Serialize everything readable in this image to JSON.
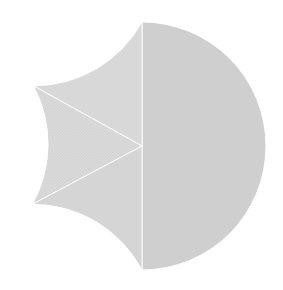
{
  "chart_data": {
    "type": "pie",
    "title": "",
    "subtitle": "",
    "xlabel": "",
    "ylabel": "",
    "grid": false,
    "legend_position": "none",
    "start_angle_deg": 90,
    "direction": "counterclockwise",
    "center_x": 142,
    "center_y": 146,
    "radius": 124,
    "categories": [
      "Slice 1",
      "Slice 2",
      "Slice 3",
      "Slice 4"
    ],
    "values": [
      50,
      17,
      16,
      17
    ],
    "labels": [
      "",
      "",
      "",
      ""
    ],
    "tick_labels": [],
    "annotations": [],
    "slices": [
      {
        "name": "Slice 1",
        "value": 50,
        "percent": 50,
        "start_deg": 90,
        "end_deg": -90,
        "color": "#cfcfcf",
        "pattern": "solid"
      },
      {
        "name": "Slice 2",
        "value": 17,
        "percent": 17,
        "start_deg": 90,
        "end_deg": 151,
        "color": "#d8d8d8",
        "pattern": "solid"
      },
      {
        "name": "Slice 3",
        "value": 16,
        "percent": 16,
        "start_deg": 151,
        "end_deg": 208,
        "color": "#dcdcdc",
        "pattern": "hatch"
      },
      {
        "name": "Slice 4",
        "value": 17,
        "percent": 17,
        "start_deg": 208,
        "end_deg": 270,
        "color": "#d5d5d5",
        "pattern": "solid"
      }
    ],
    "background_color": "#ffffff",
    "edge_color": "#ffffff"
  },
  "figure": {
    "width_px": 283,
    "height_px": 290
  }
}
